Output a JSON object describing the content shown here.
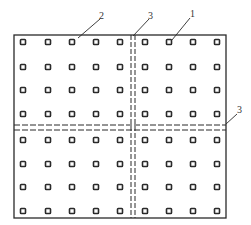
{
  "figure": {
    "type": "grid-layout-diagram",
    "frame": {
      "x": 14,
      "y": 35,
      "width": 212,
      "height": 183
    },
    "colors": {
      "line": "#2a2a2a",
      "dot": "#2a2a2a",
      "background": "#ffffff",
      "label": "#333333"
    },
    "dot_columns": [
      23,
      48,
      72,
      96,
      120,
      145,
      169,
      193,
      217
    ],
    "dot_rows": [
      42,
      67,
      90,
      114,
      140,
      164,
      187,
      211
    ],
    "dot_size": 5,
    "joints": {
      "vertical_dashed_x": [
        131,
        135
      ],
      "horizontal_dashed_y": [
        125,
        130
      ]
    },
    "callouts": [
      {
        "id": "callout-2",
        "text": "2",
        "label_x": 99,
        "label_y": 11,
        "line": [
          100,
          19,
          78,
          38
        ]
      },
      {
        "id": "callout-3-top",
        "text": "3",
        "label_x": 148,
        "label_y": 11,
        "line": [
          149,
          19,
          133,
          36
        ]
      },
      {
        "id": "callout-1",
        "text": "1",
        "label_x": 190,
        "label_y": 9,
        "line": [
          190,
          18,
          172,
          40
        ]
      },
      {
        "id": "callout-3-right",
        "text": "3",
        "label_x": 237,
        "label_y": 105,
        "line": [
          237,
          114,
          226,
          124
        ]
      }
    ]
  }
}
